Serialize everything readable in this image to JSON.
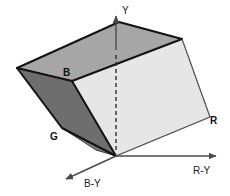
{
  "figure": {
    "background_color": "#ffffff",
    "axes": [
      {
        "id": "y-axis",
        "label": "Y",
        "label_x": 122,
        "label_y": 13,
        "direction": "up",
        "style": "solid-with-hidden-dashed",
        "x1": 116,
        "y1": 156,
        "x2": 116,
        "y2": 16,
        "dash_from_y": 140,
        "dash_to_y": 52,
        "color": "#4a4a4a"
      },
      {
        "id": "r-y-axis",
        "label": "R-Y",
        "label_x": 193,
        "label_y": 172,
        "direction": "right",
        "style": "solid",
        "x1": 116,
        "y1": 156,
        "x2": 221,
        "y2": 156,
        "color": "#4a4a4a"
      },
      {
        "id": "b-y-axis",
        "label": "B-Y",
        "label_x": 85,
        "label_y": 186,
        "direction": "down-left",
        "style": "solid",
        "x1": 116,
        "y1": 156,
        "x2": 62,
        "y2": 181,
        "color": "#4a4a4a"
      }
    ],
    "vertex_labels": [
      {
        "id": "b-vertex",
        "label": "B",
        "x": 67,
        "y": 74
      },
      {
        "id": "g-vertex",
        "label": "G",
        "x": 53,
        "y": 139
      },
      {
        "id": "r-vertex",
        "label": "R",
        "x": 212,
        "y": 122
      }
    ],
    "solid": {
      "faces": [
        {
          "id": "top-face",
          "name": "top-face",
          "fill": "#a6a6a6",
          "stroke": "#1a1a1a",
          "points": "17,68 119,22 182,39 72,81"
        },
        {
          "id": "left-dark-face",
          "name": "left-dark-face",
          "fill": "#6e6e6e",
          "stroke": "#1a1a1a",
          "points": "17,68 72,81 116,156 62,128"
        },
        {
          "id": "front-lower-face",
          "name": "front-lower-face",
          "fill": "#8c8c8c",
          "stroke": "#1a1a1a",
          "points": "62,128 116,156 100,152"
        },
        {
          "id": "front-right-face",
          "name": "front-right-face",
          "fill": "#e6e6e6",
          "stroke": "#5a5a5a",
          "points": "72,81 182,39 210,117 116,156"
        }
      ],
      "highlight_edges": [
        {
          "id": "top-back-edge",
          "x1": 17,
          "y1": 68,
          "x2": 119,
          "y2": 22
        },
        {
          "id": "top-right-edge",
          "x1": 119,
          "y1": 22,
          "x2": 182,
          "y2": 39
        },
        {
          "id": "top-front-edge",
          "x1": 17,
          "y1": 68,
          "x2": 72,
          "y2": 81
        },
        {
          "id": "top-front-edge-2",
          "x1": 72,
          "y1": 81,
          "x2": 182,
          "y2": 39
        },
        {
          "id": "left-vertical-edge",
          "x1": 17,
          "y1": 68,
          "x2": 62,
          "y2": 128
        },
        {
          "id": "b-to-origin-edge",
          "x1": 72,
          "y1": 81,
          "x2": 116,
          "y2": 156
        },
        {
          "id": "g-bottom-edge",
          "x1": 62,
          "y1": 128,
          "x2": 116,
          "y2": 156
        },
        {
          "id": "right-edge",
          "x1": 182,
          "y1": 39,
          "x2": 210,
          "y2": 117
        },
        {
          "id": "bottom-right-edge",
          "x1": 210,
          "y1": 117,
          "x2": 116,
          "y2": 156
        }
      ]
    }
  }
}
